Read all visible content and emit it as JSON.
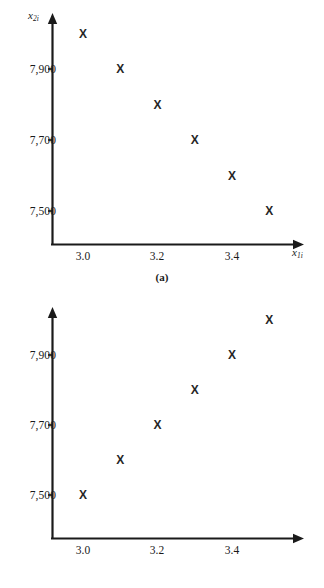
{
  "page": {
    "background": "#ffffff",
    "ink": "#1a1a1a",
    "marker_glyph": "X"
  },
  "figures": [
    {
      "id": "a",
      "caption": "(a)",
      "ylabel_base": "x",
      "ylabel_sub": "2i",
      "xlabel_base": "x",
      "xlabel_sub": "1i",
      "yticks": [
        "7,900",
        "7,700",
        "7,500"
      ],
      "xticks": [
        "3.0",
        "3.2",
        "3.4"
      ]
    },
    {
      "id": "b",
      "caption": "(b)",
      "ylabel_base": "x",
      "ylabel_sub": "2i",
      "xlabel_base": "x",
      "xlabel_sub": "1i",
      "yticks": [
        "7,900",
        "7,700",
        "7,500"
      ],
      "xticks": [
        "3.0",
        "3.2",
        "3.4"
      ]
    }
  ],
  "chart_data": [
    {
      "type": "scatter",
      "title": "(a)",
      "xlabel": "x1i",
      "ylabel": "x2i",
      "marker": "X",
      "grid": false,
      "legend": false,
      "xlim": [
        2.93,
        3.58
      ],
      "ylim": [
        7380,
        8060
      ],
      "xticks": [
        3.0,
        3.2,
        3.4
      ],
      "yticks": [
        7500,
        7700,
        7900
      ],
      "xtick_labels": [
        "3.0",
        "3.2",
        "3.4"
      ],
      "ytick_labels": [
        "7,500",
        "7,700",
        "7,900"
      ],
      "x": [
        3.0,
        3.1,
        3.2,
        3.3,
        3.4,
        3.5
      ],
      "y": [
        8000,
        7900,
        7800,
        7700,
        7600,
        7500
      ],
      "points": [
        {
          "x": 3.0,
          "y": 8000
        },
        {
          "x": 3.1,
          "y": 7900
        },
        {
          "x": 3.2,
          "y": 7800
        },
        {
          "x": 3.3,
          "y": 7700
        },
        {
          "x": 3.4,
          "y": 7600
        },
        {
          "x": 3.5,
          "y": 7500
        }
      ]
    },
    {
      "type": "scatter",
      "title": "(b)",
      "xlabel": "x1i",
      "ylabel": "x2i",
      "marker": "X",
      "grid": false,
      "legend": false,
      "xlim": [
        2.93,
        3.58
      ],
      "ylim": [
        7380,
        8060
      ],
      "xticks": [
        3.0,
        3.2,
        3.4
      ],
      "yticks": [
        7500,
        7700,
        7900
      ],
      "xtick_labels": [
        "3.0",
        "3.2",
        "3.4"
      ],
      "ytick_labels": [
        "7,500",
        "7,700",
        "7,900"
      ],
      "x": [
        3.0,
        3.1,
        3.2,
        3.3,
        3.4,
        3.5
      ],
      "y": [
        7500,
        7600,
        7700,
        7800,
        7900,
        8000
      ],
      "points": [
        {
          "x": 3.0,
          "y": 7500
        },
        {
          "x": 3.1,
          "y": 7600
        },
        {
          "x": 3.2,
          "y": 7700
        },
        {
          "x": 3.3,
          "y": 7800
        },
        {
          "x": 3.4,
          "y": 7900
        },
        {
          "x": 3.5,
          "y": 8000
        }
      ]
    }
  ]
}
